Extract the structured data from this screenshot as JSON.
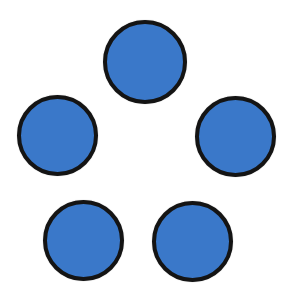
{
  "figure": {
    "fill_color": "#3a78c9",
    "stroke_color": "#141414",
    "circles": [
      {
        "id": "top",
        "x": 103,
        "y": 20,
        "d": 84
      },
      {
        "id": "left",
        "x": 17,
        "y": 95,
        "d": 81
      },
      {
        "id": "right",
        "x": 195,
        "y": 96,
        "d": 81
      },
      {
        "id": "bottom-left",
        "x": 43,
        "y": 200,
        "d": 81
      },
      {
        "id": "bottom-right",
        "x": 152,
        "y": 201,
        "d": 81
      }
    ]
  }
}
